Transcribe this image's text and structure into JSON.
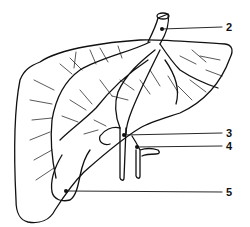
{
  "diagram": {
    "labels": [
      {
        "id": "2",
        "text": "2",
        "x": 226,
        "y": 22
      },
      {
        "id": "3",
        "text": "3",
        "x": 226,
        "y": 128
      },
      {
        "id": "4",
        "text": "4",
        "x": 226,
        "y": 141
      },
      {
        "id": "5",
        "text": "5",
        "x": 226,
        "y": 187
      }
    ],
    "colors": {
      "stroke": "#111111",
      "background": "#ffffff"
    }
  }
}
